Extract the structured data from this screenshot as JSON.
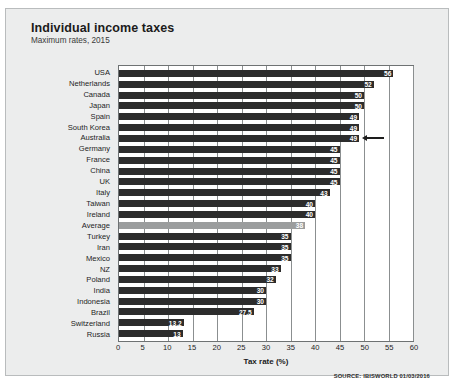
{
  "header": {
    "title": "Individual income taxes",
    "subtitle": "Maximum rates, 2015"
  },
  "source_note": "SOURCE: IBISWORLD 01/03/2016",
  "colors": {
    "bar": "#2c2c2c",
    "average_bar": "#9b9d9e",
    "panel": "#eceded",
    "plot_background": "#ffffff",
    "gridline": "#8b8f90",
    "axis": "#6e7273",
    "text": "#1d1d1d"
  },
  "annotation": {
    "type": "arrow-left",
    "target_category": "Australia",
    "target_value": 49
  },
  "chart_data": {
    "type": "bar",
    "orientation": "horizontal",
    "title": "Individual income taxes",
    "subtitle": "Maximum rates, 2015",
    "xlabel": "Tax rate (%)",
    "ylabel": "",
    "xlim": [
      0,
      60
    ],
    "xticks": [
      0,
      5,
      10,
      15,
      20,
      25,
      30,
      35,
      40,
      45,
      50,
      55,
      60
    ],
    "grid": true,
    "legend": false,
    "highlight_category": "Average",
    "categories": [
      "USA",
      "Netherlands",
      "Canada",
      "Japan",
      "Spain",
      "South Korea",
      "Australia",
      "Germany",
      "France",
      "China",
      "UK",
      "Italy",
      "Taiwan",
      "Ireland",
      "Average",
      "Turkey",
      "Iran",
      "Mexico",
      "NZ",
      "Poland",
      "India",
      "Indonesia",
      "Brazil",
      "Switzerland",
      "Russia"
    ],
    "values": [
      56,
      52,
      50,
      50,
      49,
      49,
      49,
      45,
      45,
      45,
      45,
      43,
      40,
      40,
      38,
      35,
      35,
      35,
      33,
      32,
      30,
      30,
      27.5,
      13.2,
      13
    ],
    "labels": [
      "56",
      "52",
      "50",
      "50",
      "49",
      "49",
      "49",
      "45",
      "45",
      "45",
      "45",
      "43",
      "40",
      "40",
      "38",
      "35",
      "35",
      "35",
      "33",
      "32",
      "30",
      "30",
      "27.5",
      "13.2",
      "13"
    ]
  }
}
